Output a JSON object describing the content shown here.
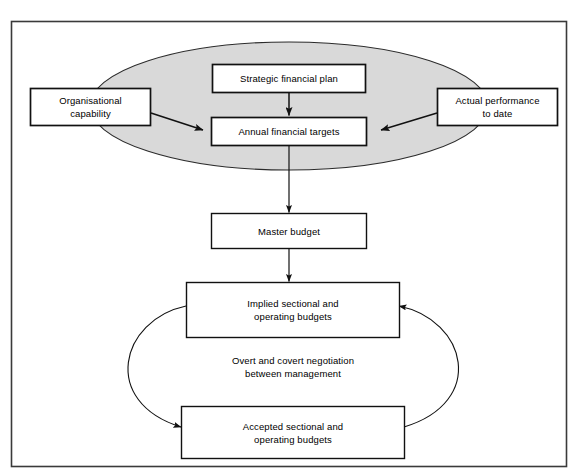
{
  "figure": {
    "type": "flow-diagram",
    "frame": {
      "present": true,
      "border_color": "#3a3a3a"
    },
    "background_color": "#ffffff",
    "ellipse": {
      "name": "planning-envelope",
      "fill_color": "#d9d9d9",
      "stroke_color": "#2b2b2b"
    },
    "nodes": [
      {
        "id": "strategic-financial-plan",
        "label": "Strategic financial plan",
        "lines": [
          "Strategic financial plan"
        ]
      },
      {
        "id": "organisational-capability",
        "label": "Organisational capability",
        "lines": [
          "Organisational",
          "capability"
        ]
      },
      {
        "id": "actual-performance-to-date",
        "label": "Actual performance to date",
        "lines": [
          "Actual performance",
          "to date"
        ]
      },
      {
        "id": "annual-financial-targets",
        "label": "Annual financial targets",
        "lines": [
          "Annual financial targets"
        ]
      },
      {
        "id": "master-budget",
        "label": "Master budget",
        "lines": [
          "Master budget"
        ]
      },
      {
        "id": "implied-sectional-and-operating-budgets",
        "label": "Implied sectional and operating budgets",
        "lines": [
          "Implied sectional and",
          "operating budgets"
        ]
      },
      {
        "id": "accepted-sectional-and-operating-budgets",
        "label": "Accepted sectional and operating budgets",
        "lines": [
          "Accepted sectional and",
          "operating budgets"
        ]
      }
    ],
    "annotations": [
      {
        "id": "negotiation-note",
        "label": "Overt and covert negotiation between management",
        "lines": [
          "Overt and covert negotiation",
          "between management"
        ]
      }
    ],
    "edges": [
      {
        "from": "strategic-financial-plan",
        "to": "annual-financial-targets",
        "style": "straight-arrow"
      },
      {
        "from": "organisational-capability",
        "to": "annual-financial-targets",
        "style": "straight-arrow"
      },
      {
        "from": "actual-performance-to-date",
        "to": "annual-financial-targets",
        "style": "straight-arrow"
      },
      {
        "from": "annual-financial-targets",
        "to": "master-budget",
        "style": "straight-arrow"
      },
      {
        "from": "master-budget",
        "to": "implied-sectional-and-operating-budgets",
        "style": "straight-arrow"
      },
      {
        "from": "implied-sectional-and-operating-budgets",
        "to": "accepted-sectional-and-operating-budgets",
        "style": "curved-arrow-left"
      },
      {
        "from": "accepted-sectional-and-operating-budgets",
        "to": "implied-sectional-and-operating-budgets",
        "style": "curved-arrow-right"
      }
    ]
  }
}
